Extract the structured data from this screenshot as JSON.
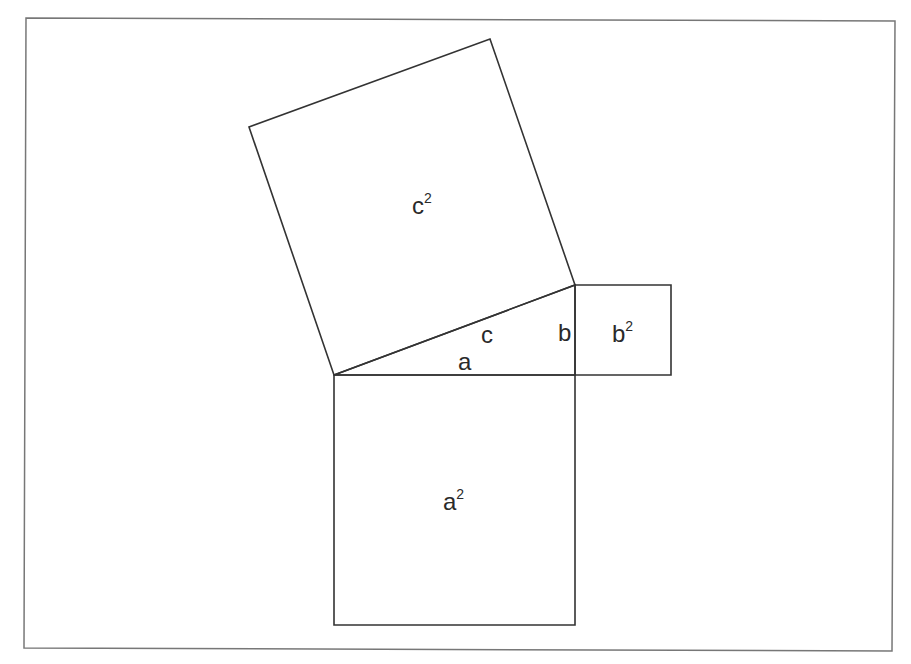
{
  "figure": {
    "stroke_color": "#333333",
    "frame_color": "#777777"
  },
  "shapes": {
    "frame": {
      "points": "26,18 895,21 892,651 24,648"
    },
    "square_c": {
      "label": "c",
      "exp": "2",
      "points": "334,375 575,285 490,39 249,127"
    },
    "square_a": {
      "label": "a",
      "exp": "2",
      "points": "334,375 575,375 575,625 334,625"
    },
    "square_b": {
      "label": "b",
      "exp": "2",
      "points": "575,285 671,285 671,375 575,375"
    },
    "triangle": {
      "points": "334,375 575,375 575,285"
    }
  },
  "labels": {
    "c2": {
      "base": "c",
      "exp": "2"
    },
    "a2": {
      "base": "a",
      "exp": "2"
    },
    "b2": {
      "base": "b",
      "exp": "2"
    },
    "side_a": "a",
    "side_b": "b",
    "side_c": "c"
  }
}
